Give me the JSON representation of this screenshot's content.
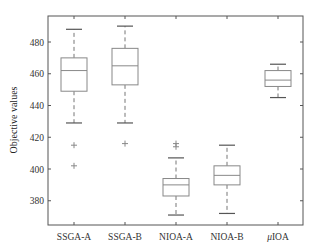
{
  "chart_data": {
    "type": "boxplot",
    "title": "",
    "xlabel": "",
    "ylabel": "Objective values",
    "ylim": [
      363,
      496
    ],
    "yticks": [
      380,
      400,
      420,
      440,
      460,
      480
    ],
    "grid": false,
    "legend": null,
    "categories": [
      "SSGA-A",
      "SSGA-B",
      "NIOA-A",
      "NIOA-B",
      "μIOA"
    ],
    "series": [
      {
        "name": "SSGA-A",
        "whisker_low": 429,
        "q1": 449,
        "median": 462,
        "q3": 470,
        "whisker_high": 488,
        "outliers": [
          415,
          402
        ]
      },
      {
        "name": "SSGA-B",
        "whisker_low": 429,
        "q1": 453,
        "median": 465,
        "q3": 476,
        "whisker_high": 490,
        "outliers": [
          416
        ]
      },
      {
        "name": "NIOA-A",
        "whisker_low": 371,
        "q1": 383,
        "median": 390,
        "q3": 394,
        "whisker_high": 407,
        "outliers": [
          416,
          414
        ]
      },
      {
        "name": "NIOA-B",
        "whisker_low": 372,
        "q1": 390,
        "median": 396,
        "q3": 402,
        "whisker_high": 415,
        "outliers": []
      },
      {
        "name": "μIOA",
        "whisker_low": 445,
        "q1": 452,
        "median": 456,
        "q3": 462,
        "whisker_high": 466,
        "outliers": []
      }
    ]
  },
  "labels": {
    "ylabel": "Objective values",
    "categories": [
      "SSGA-A",
      "SSGA-B",
      "NIOA-A",
      "NIOA-B",
      "μIOA"
    ]
  },
  "colors": {
    "axis": "#555555",
    "box": "#888888",
    "whisker": "#777777",
    "cap": "#555555",
    "outlier": "#888888"
  }
}
